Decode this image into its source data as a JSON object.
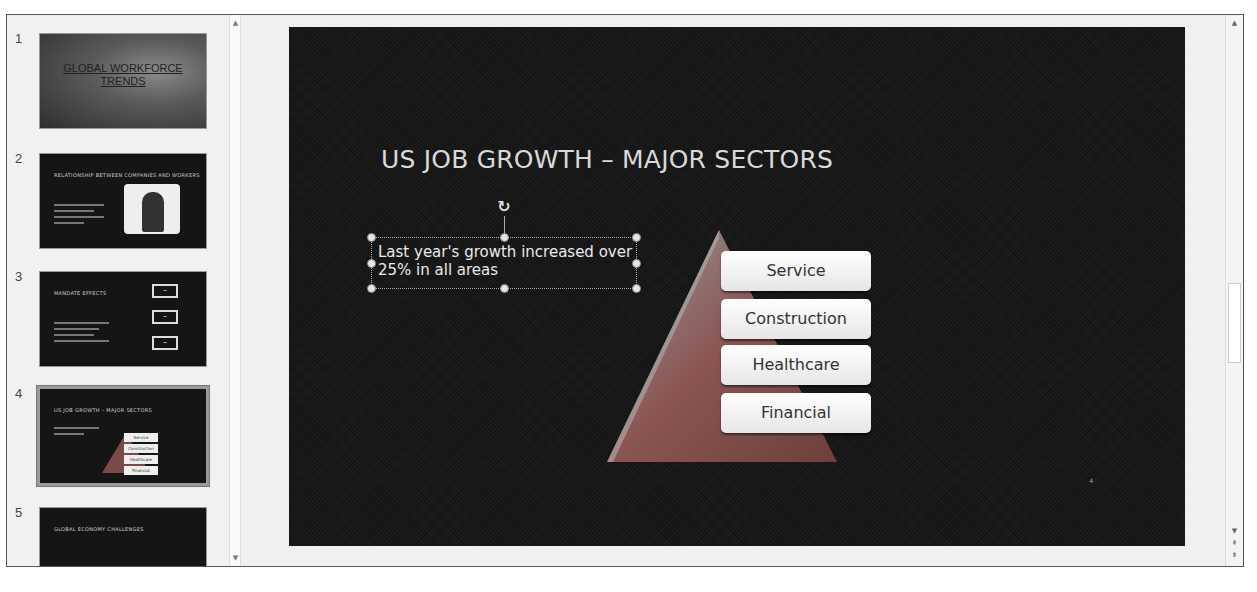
{
  "thumbnails": [
    {
      "number": "1",
      "title": "GLOBAL WORKFORCE TRENDS",
      "selected": false
    },
    {
      "number": "2",
      "title": "RELATIONSHIP BETWEEN COMPANIES AND WORKERS",
      "selected": false
    },
    {
      "number": "3",
      "title": "MANDATE EFFECTS",
      "selected": false
    },
    {
      "number": "4",
      "title": "US JOB GROWTH – MAJOR SECTORS",
      "selected": true
    },
    {
      "number": "5",
      "title": "GLOBAL ECONOMY CHALLENGES",
      "selected": false
    }
  ],
  "slide": {
    "title": "US JOB GROWTH – MAJOR SECTORS",
    "textbox": "Last year's growth increased over 25% in all areas",
    "sectors": [
      "Service",
      "Construction",
      "Healthcare",
      "Financial"
    ],
    "slide_number_mark": "4"
  },
  "icons": {
    "scroll_up": "▲",
    "scroll_down": "▼",
    "prev_slide": "⇞",
    "next_slide": "⇟",
    "rotate": "↻"
  },
  "colors": {
    "slide_bg": "#141414",
    "pyramid": "#8a5552",
    "sector_box": "#f2f2f2"
  }
}
